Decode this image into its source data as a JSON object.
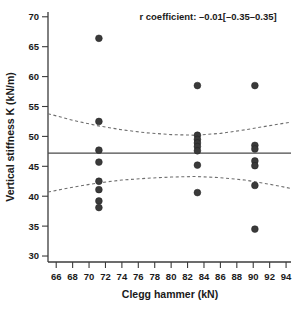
{
  "chart_data": {
    "type": "scatter",
    "title": "",
    "xlabel": "Clegg hammer (kN)",
    "ylabel": "Vertical stiffness K (kN/m)",
    "xlim": [
      65,
      94.6
    ],
    "ylim": [
      29,
      70.8
    ],
    "xticks": [
      66,
      68,
      70,
      72,
      74,
      76,
      78,
      80,
      82,
      84,
      86,
      88,
      90,
      92,
      94
    ],
    "yticks": [
      30,
      35,
      40,
      45,
      50,
      55,
      60,
      65,
      70
    ],
    "grid": false,
    "legend": null,
    "annotations": [
      {
        "name": "r-coefficient",
        "text": "r coefficient: –0.01[–0.35–0.35]",
        "x": 84.5,
        "y": 69.5
      }
    ],
    "points": [
      {
        "x": 71.2,
        "y": 66.4
      },
      {
        "x": 71.2,
        "y": 52.5
      },
      {
        "x": 71.2,
        "y": 47.7
      },
      {
        "x": 71.2,
        "y": 45.7
      },
      {
        "x": 71.2,
        "y": 42.5
      },
      {
        "x": 71.2,
        "y": 41.1
      },
      {
        "x": 71.2,
        "y": 39.2
      },
      {
        "x": 71.2,
        "y": 38.1
      },
      {
        "x": 83.2,
        "y": 58.5
      },
      {
        "x": 83.2,
        "y": 50.2
      },
      {
        "x": 83.2,
        "y": 49.5
      },
      {
        "x": 83.2,
        "y": 48.9
      },
      {
        "x": 83.2,
        "y": 48.3
      },
      {
        "x": 83.2,
        "y": 47.6
      },
      {
        "x": 83.2,
        "y": 45.2
      },
      {
        "x": 83.2,
        "y": 40.6
      },
      {
        "x": 90.2,
        "y": 58.5
      },
      {
        "x": 90.2,
        "y": 48.5
      },
      {
        "x": 90.2,
        "y": 47.9
      },
      {
        "x": 90.2,
        "y": 45.9
      },
      {
        "x": 90.2,
        "y": 45.1
      },
      {
        "x": 90.2,
        "y": 41.8
      },
      {
        "x": 90.2,
        "y": 34.5
      }
    ],
    "regression_line": {
      "name": "mean-fit-line",
      "style": "solid",
      "y_value": 47.2,
      "x_from": 65,
      "x_to": 94.6
    },
    "confidence_bands": [
      {
        "name": "upper-confidence-band",
        "style": "dashed",
        "points": [
          {
            "x": 65.0,
            "y": 53.8
          },
          {
            "x": 68.0,
            "y": 52.7
          },
          {
            "x": 71.0,
            "y": 51.8
          },
          {
            "x": 74.0,
            "y": 51.1
          },
          {
            "x": 77.0,
            "y": 50.6
          },
          {
            "x": 80.0,
            "y": 50.3
          },
          {
            "x": 83.0,
            "y": 50.2
          },
          {
            "x": 86.0,
            "y": 50.5
          },
          {
            "x": 89.0,
            "y": 51.1
          },
          {
            "x": 92.0,
            "y": 51.8
          },
          {
            "x": 94.6,
            "y": 52.4
          }
        ]
      },
      {
        "name": "lower-confidence-band",
        "style": "dashed",
        "points": [
          {
            "x": 65.0,
            "y": 40.7
          },
          {
            "x": 68.0,
            "y": 41.5
          },
          {
            "x": 71.0,
            "y": 42.2
          },
          {
            "x": 74.0,
            "y": 42.7
          },
          {
            "x": 77.0,
            "y": 43.0
          },
          {
            "x": 80.0,
            "y": 43.2
          },
          {
            "x": 83.0,
            "y": 43.3
          },
          {
            "x": 86.0,
            "y": 43.1
          },
          {
            "x": 89.0,
            "y": 42.7
          },
          {
            "x": 92.0,
            "y": 42.0
          },
          {
            "x": 94.6,
            "y": 41.3
          }
        ]
      }
    ],
    "colors": {
      "point": "#3a3a3a",
      "fit_line": "#4a4a4a",
      "ci_band": "#6e6e6e",
      "axis": "#3b3b3b",
      "background": "#ffffff"
    }
  }
}
